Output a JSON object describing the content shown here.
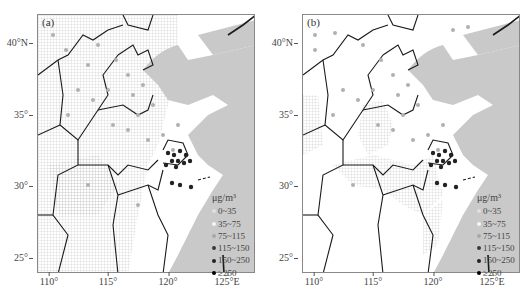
{
  "figure": {
    "units": "μg/m³",
    "x_ticks": [
      {
        "label": "110°",
        "x": 12
      },
      {
        "label": "115°",
        "x": 71
      },
      {
        "label": "120°",
        "x": 131
      },
      {
        "label": "125°E",
        "x": 190
      }
    ],
    "y_ticks": [
      {
        "label": "40°N",
        "y": 43
      },
      {
        "label": "35°",
        "y": 115
      },
      {
        "label": "30°",
        "y": 186
      },
      {
        "label": "25°",
        "y": 258
      }
    ],
    "legend": {
      "title": "μg/m³",
      "items": [
        {
          "label": "0~35",
          "color": "#e6e6e6"
        },
        {
          "label": "35~75",
          "color": "#f2f2f2"
        },
        {
          "label": "75~115",
          "color": "#a8a8a8"
        },
        {
          "label": "115~150",
          "color": "#3a3a3a"
        },
        {
          "label": "150~250",
          "color": "#222222"
        },
        {
          "label": "≥250",
          "color": "#000000"
        }
      ]
    },
    "colors": {
      "sea": "#c9c9c9",
      "land": "#ffffff",
      "grid_texture": "#d0d0d0",
      "border": "#1a1a1a",
      "frame": "#888888"
    },
    "panels": [
      {
        "id": "a",
        "label": "(a)"
      },
      {
        "id": "b",
        "label": "(b)"
      }
    ]
  }
}
